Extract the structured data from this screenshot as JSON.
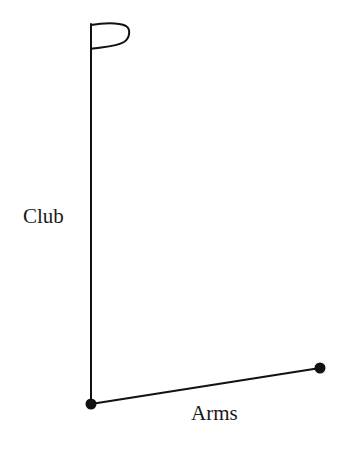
{
  "diagram": {
    "labels": {
      "club": "Club",
      "arms": "Arms"
    },
    "colors": {
      "line": "#111111",
      "text": "#1a1a1a",
      "background": "#ffffff"
    },
    "elements": {
      "club_line": {
        "x1": 91,
        "y1": 24,
        "x2": 91,
        "y2": 404
      },
      "arms_line": {
        "x1": 91,
        "y1": 404,
        "x2": 320,
        "y2": 368
      },
      "flag_icon": "flag",
      "joints": [
        {
          "name": "shoulder-pivot",
          "cx": 91,
          "cy": 404,
          "r": 5.5
        },
        {
          "name": "hand-joint",
          "cx": 320,
          "cy": 368,
          "r": 5.5
        }
      ]
    }
  }
}
